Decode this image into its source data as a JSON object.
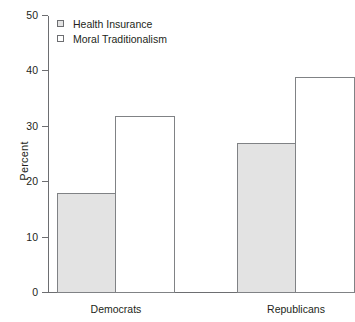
{
  "chart_data": {
    "type": "bar",
    "title": "",
    "xlabel": "",
    "ylabel": "Percent",
    "ylim": [
      0,
      50
    ],
    "yticks": [
      0,
      10,
      20,
      30,
      40,
      50
    ],
    "ytick_labels": [
      "0",
      "10",
      "20",
      "30",
      "40",
      "50"
    ],
    "grid": false,
    "legend_position": "top-left",
    "categories": [
      "Democrats",
      "Republicans"
    ],
    "series": [
      {
        "name": "Health Insurance",
        "values": [
          18,
          27
        ],
        "fill": "#e3e3e3",
        "border": "#808285",
        "swatch": "filled"
      },
      {
        "name": "Moral Traditionalism",
        "values": [
          32,
          39
        ],
        "fill": "#ffffff",
        "border": "#808285",
        "swatch": "unfilled"
      }
    ]
  },
  "axis": {
    "y_title": "Percent",
    "tick_0": "0",
    "tick_10": "10",
    "tick_20": "20",
    "tick_30": "30",
    "tick_40": "40",
    "tick_50": "50"
  },
  "legend": {
    "item_0": "Health Insurance",
    "item_1": "Moral Traditionalism"
  },
  "groups": {
    "label_0": "Democrats",
    "label_1": "Republicans"
  }
}
